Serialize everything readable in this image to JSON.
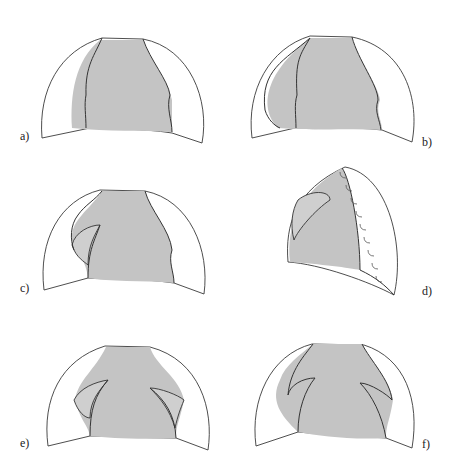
{
  "figure": {
    "panels": [
      {
        "id": "a",
        "label": "a)"
      },
      {
        "id": "b",
        "label": "b)"
      },
      {
        "id": "c",
        "label": "c)"
      },
      {
        "id": "d",
        "label": "d)"
      },
      {
        "id": "e",
        "label": "e)"
      },
      {
        "id": "f",
        "label": "f)"
      }
    ]
  },
  "colors": {
    "shade": "#c4c4c4",
    "outline": "#333333",
    "background": "#ffffff"
  }
}
